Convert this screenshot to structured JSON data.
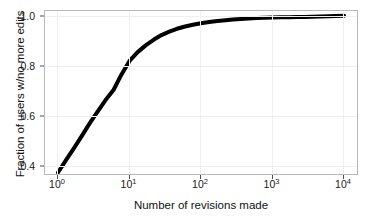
{
  "chart_data": {
    "type": "line",
    "title": "",
    "xlabel": "Number of revisions made",
    "ylabel": "Fraction of users w/no more edits",
    "xscale": "log",
    "yscale": "linear",
    "xlim": [
      1,
      10000
    ],
    "ylim": [
      0.37,
      1.02
    ],
    "grid": true,
    "legend": null,
    "xticks": [
      {
        "value": 1,
        "label": "10",
        "exponent": "0"
      },
      {
        "value": 10,
        "label": "10",
        "exponent": "1"
      },
      {
        "value": 100,
        "label": "10",
        "exponent": "2"
      },
      {
        "value": 1000,
        "label": "10",
        "exponent": "3"
      },
      {
        "value": 10000,
        "label": "10",
        "exponent": "4"
      }
    ],
    "yticks": [
      {
        "value": 0.4,
        "label": "0.4"
      },
      {
        "value": 0.6,
        "label": "0.6"
      },
      {
        "value": 0.8,
        "label": "0.8"
      },
      {
        "value": 1.0,
        "label": "1.0"
      }
    ],
    "series": [
      {
        "name": "Fraction of users w/no more edits",
        "color": "#000000",
        "linewidth": 4,
        "x": [
          1,
          1.3,
          1.7,
          2.2,
          2.8,
          3.6,
          4.6,
          6.0,
          7.7,
          10,
          13,
          17,
          22,
          28,
          36,
          46,
          60,
          77,
          100,
          130,
          170,
          220,
          280,
          360,
          460,
          600,
          770,
          1000,
          1300,
          1700,
          2200,
          2800,
          3600,
          4600,
          6000,
          7700,
          10000
        ],
        "y": [
          0.38,
          0.43,
          0.48,
          0.53,
          0.578,
          0.624,
          0.668,
          0.71,
          0.77,
          0.825,
          0.86,
          0.888,
          0.91,
          0.928,
          0.942,
          0.953,
          0.962,
          0.969,
          0.975,
          0.98,
          0.984,
          0.987,
          0.99,
          0.992,
          0.994,
          0.996,
          0.997,
          0.998,
          0.999,
          0.999,
          1.0,
          1.0,
          1.001,
          1.002,
          1.003,
          1.004,
          1.005
        ]
      }
    ]
  },
  "figure": {
    "background": "#ffffff",
    "panel_background": "#ffffff",
    "panel_border_color": "#b9b9b9",
    "grid_color": "#efefef",
    "tick_color": "#4d4d4d",
    "text_color": "#1a1a1a"
  }
}
